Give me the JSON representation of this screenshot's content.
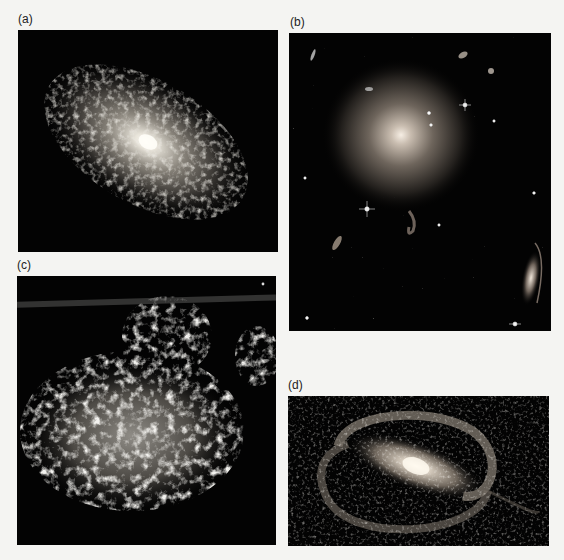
{
  "figure": {
    "panels": [
      {
        "id": "a",
        "label": "(a)",
        "subject": "spiral-galaxy-face-on-tilted"
      },
      {
        "id": "b",
        "label": "(b)",
        "subject": "elliptical-galaxy-field"
      },
      {
        "id": "c",
        "label": "(c)",
        "subject": "irregular-galaxy"
      },
      {
        "id": "d",
        "label": "(d)",
        "subject": "barred-spiral-galaxy"
      }
    ]
  }
}
